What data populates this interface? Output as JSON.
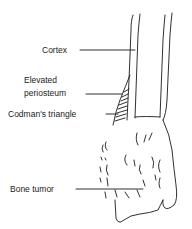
{
  "diagram": {
    "title": "",
    "labels": {
      "cortex": "Cortex",
      "elevated_periosteum_line1": "Elevated",
      "elevated_periosteum_line2": "periosteum",
      "codmans_triangle": "Codman's triangle",
      "bone_tumor": "Bone tumor"
    },
    "colors": {
      "stroke": "#1a1a1a",
      "background": "#ffffff"
    }
  }
}
